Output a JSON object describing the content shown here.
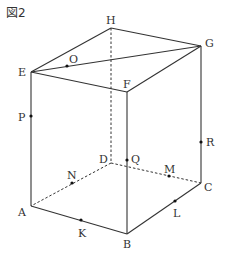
{
  "figure": {
    "title": "図2",
    "shape": "rectangular-prism",
    "vertices": {
      "A": {
        "label": "A",
        "x": 31,
        "y": 206
      },
      "B": {
        "label": "B",
        "x": 127,
        "y": 234
      },
      "C": {
        "label": "C",
        "x": 201,
        "y": 183
      },
      "D": {
        "label": "D",
        "x": 111,
        "y": 163
      },
      "E": {
        "label": "E",
        "x": 31,
        "y": 72
      },
      "F": {
        "label": "F",
        "x": 127,
        "y": 92
      },
      "G": {
        "label": "G",
        "x": 201,
        "y": 46
      },
      "H": {
        "label": "H",
        "x": 111,
        "y": 28
      }
    },
    "points": {
      "O": {
        "label": "O",
        "x": 67,
        "y": 66
      },
      "P": {
        "label": "P",
        "x": 31,
        "y": 116
      },
      "Q": {
        "label": "Q",
        "x": 127,
        "y": 160
      },
      "R": {
        "label": "R",
        "x": 201,
        "y": 142
      },
      "M": {
        "label": "M",
        "x": 169,
        "y": 176
      },
      "N": {
        "label": "N",
        "x": 72,
        "y": 183
      },
      "K": {
        "label": "K",
        "x": 81,
        "y": 220
      },
      "L": {
        "label": "L",
        "x": 175,
        "y": 201
      }
    },
    "edges_solid": [
      "EH",
      "HG",
      "GF",
      "FE",
      "EG",
      "EA",
      "FB",
      "GC",
      "AB",
      "BC"
    ],
    "edges_hidden": [
      "HD",
      "DA",
      "DC"
    ]
  }
}
